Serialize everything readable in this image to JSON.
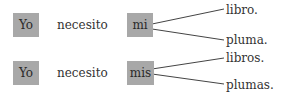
{
  "rows": [
    {
      "subject": "Yo",
      "verb": "necesito",
      "determiner": "mi",
      "nouns": [
        "libro.",
        "pluma."
      ]
    },
    {
      "subject": "Yo",
      "verb": "necesito",
      "determiner": "mis",
      "nouns": [
        "libros.",
        "plumas."
      ]
    }
  ],
  "colors": {
    "box_fill": "#a8a8a8",
    "line": "#444444",
    "text": "#333333"
  }
}
